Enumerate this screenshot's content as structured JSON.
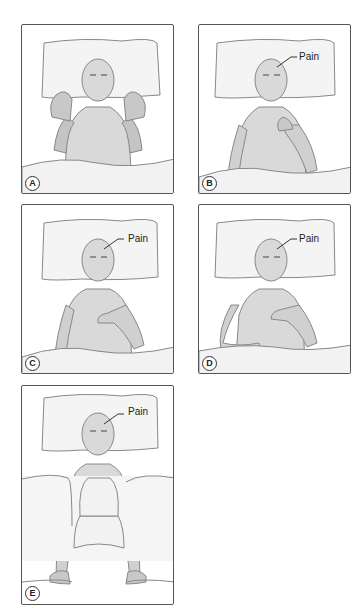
{
  "figure": {
    "panels": [
      {
        "id": "A",
        "label": "A",
        "pain_label": null,
        "pose": "both hands raised beside head, palms open"
      },
      {
        "id": "B",
        "label": "B",
        "pain_label": "Pain",
        "pose": "right hand to chin/throat"
      },
      {
        "id": "C",
        "label": "C",
        "pain_label": "Pain",
        "pose": "left hand over chest"
      },
      {
        "id": "D",
        "label": "D",
        "pain_label": "Pain",
        "pose": "hand on chest, other hand on sheet"
      },
      {
        "id": "E",
        "label": "E",
        "pain_label": "Pain",
        "pose": "arms straight at sides gripping sheet"
      }
    ],
    "colors": {
      "border": "#555555",
      "skin": "#d9d9d9",
      "skin_shade": "#b8b8b8",
      "pillow": "#f4f4f4",
      "sheet": "#f2f2f2",
      "line": "#777777"
    }
  }
}
